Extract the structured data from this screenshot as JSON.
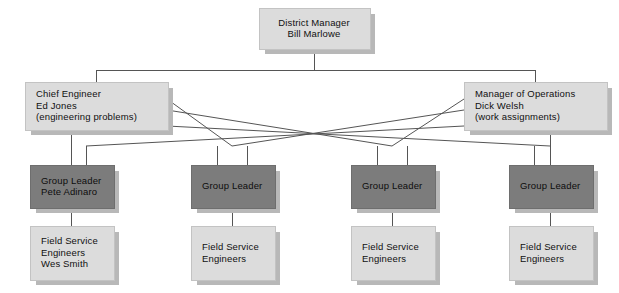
{
  "chart": {
    "type": "org-chart",
    "colors": {
      "light_box": "#dcdcdc",
      "dark_box": "#7c7c7c",
      "shadow": "#b8b8b8",
      "line": "#555555",
      "text": "#101010",
      "background": "#ffffff"
    },
    "levels": [
      {
        "name": "executive",
        "nodes": [
          {
            "id": "district-manager",
            "style": "light",
            "align": "center",
            "lines": [
              "District Manager",
              "Bill Marlowe"
            ],
            "x": 259,
            "y": 8,
            "w": 110,
            "h": 40
          }
        ]
      },
      {
        "name": "managers",
        "nodes": [
          {
            "id": "chief-engineer",
            "style": "light",
            "align": "left",
            "lines": [
              "Chief Engineer",
              "Ed Jones",
              "(engineering problems)"
            ],
            "x": 25,
            "y": 82,
            "w": 142,
            "h": 47
          },
          {
            "id": "manager-of-operations",
            "style": "light",
            "align": "left",
            "lines": [
              "Manager of Operations",
              "Dick Welsh",
              "(work assignments)"
            ],
            "x": 464,
            "y": 82,
            "w": 142,
            "h": 47
          }
        ]
      },
      {
        "name": "group-leaders",
        "nodes": [
          {
            "id": "group-leader-1",
            "style": "dark",
            "align": "left",
            "lines": [
              "Group Leader",
              "Pete Adinaro"
            ],
            "x": 30,
            "y": 165,
            "w": 83,
            "h": 42
          },
          {
            "id": "group-leader-2",
            "style": "dark",
            "align": "left",
            "lines": [
              "Group Leader"
            ],
            "x": 191,
            "y": 165,
            "w": 83,
            "h": 42
          },
          {
            "id": "group-leader-3",
            "style": "dark",
            "align": "left",
            "lines": [
              "Group Leader"
            ],
            "x": 351,
            "y": 165,
            "w": 83,
            "h": 42
          },
          {
            "id": "group-leader-4",
            "style": "dark",
            "align": "left",
            "lines": [
              "Group Leader"
            ],
            "x": 509,
            "y": 165,
            "w": 83,
            "h": 42
          }
        ]
      },
      {
        "name": "field-service",
        "nodes": [
          {
            "id": "field-service-1",
            "style": "light",
            "align": "left",
            "lines": [
              "Field Service",
              "Engineers",
              "Wes Smith"
            ],
            "x": 30,
            "y": 226,
            "w": 83,
            "h": 53
          },
          {
            "id": "field-service-2",
            "style": "light",
            "align": "left",
            "lines": [
              "Field Service",
              "Engineers"
            ],
            "x": 191,
            "y": 226,
            "w": 83,
            "h": 53
          },
          {
            "id": "field-service-3",
            "style": "light",
            "align": "left",
            "lines": [
              "Field Service",
              "Engineers"
            ],
            "x": 351,
            "y": 226,
            "w": 83,
            "h": 53
          },
          {
            "id": "field-service-4",
            "style": "light",
            "align": "left",
            "lines": [
              "Field Service",
              "Engineers"
            ],
            "x": 509,
            "y": 226,
            "w": 83,
            "h": 53
          }
        ]
      }
    ],
    "connections": [
      {
        "from": "district-manager",
        "to": "chief-engineer",
        "kind": "orthogonal"
      },
      {
        "from": "district-manager",
        "to": "manager-of-operations",
        "kind": "orthogonal"
      },
      {
        "from": "chief-engineer",
        "to": "group-leader-1",
        "kind": "vertical"
      },
      {
        "from": "chief-engineer",
        "to": "group-leader-2",
        "kind": "diagonal"
      },
      {
        "from": "chief-engineer",
        "to": "group-leader-3",
        "kind": "diagonal"
      },
      {
        "from": "chief-engineer",
        "to": "group-leader-4",
        "kind": "diagonal"
      },
      {
        "from": "manager-of-operations",
        "to": "group-leader-1",
        "kind": "diagonal"
      },
      {
        "from": "manager-of-operations",
        "to": "group-leader-2",
        "kind": "diagonal"
      },
      {
        "from": "manager-of-operations",
        "to": "group-leader-3",
        "kind": "diagonal"
      },
      {
        "from": "manager-of-operations",
        "to": "group-leader-4",
        "kind": "vertical"
      },
      {
        "from": "group-leader-1",
        "to": "field-service-1",
        "kind": "vertical"
      },
      {
        "from": "group-leader-2",
        "to": "field-service-2",
        "kind": "vertical"
      },
      {
        "from": "group-leader-3",
        "to": "field-service-3",
        "kind": "vertical"
      },
      {
        "from": "group-leader-4",
        "to": "field-service-4",
        "kind": "vertical"
      }
    ]
  }
}
